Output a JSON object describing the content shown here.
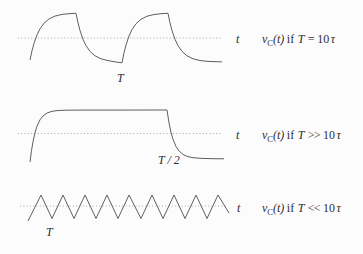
{
  "figure": {
    "colors": {
      "background": "#fcfcfc",
      "curve": "#5f5f5f",
      "axis_dots": "#a9a9a9",
      "text": "#2e2e2e"
    },
    "rows": [
      {
        "shape": "exponential charge-discharge wave",
        "axis_label": "t",
        "wave_label": "T",
        "condition": {
          "func": "v",
          "func_sub": "C",
          "func_arg": "(t)",
          "if_word": "if",
          "period_var": "T",
          "relation": "=",
          "value": "10",
          "tau": "τ"
        }
      },
      {
        "shape": "near square wave with rounded exponential edges",
        "axis_label": "t",
        "wave_label": "T / 2",
        "condition": {
          "func": "v",
          "func_sub": "C",
          "func_arg": "(t)",
          "if_word": "if",
          "period_var": "T",
          "relation": ">>",
          "value": "10",
          "tau": "τ"
        }
      },
      {
        "shape": "triangle wave",
        "axis_label": "t",
        "wave_label": "T",
        "condition": {
          "func": "v",
          "func_sub": "C",
          "func_arg": "(t)",
          "if_word": "if",
          "period_var": "T",
          "relation": "<<",
          "value": "10",
          "tau": "τ"
        }
      }
    ]
  }
}
